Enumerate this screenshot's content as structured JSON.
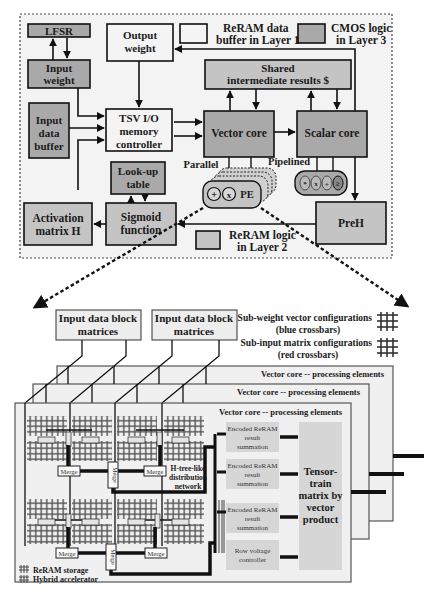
{
  "top_diagram": {
    "blocks": {
      "lfsr": "LFSR",
      "input_weight": [
        "Input",
        "weight"
      ],
      "output_weight": [
        "Output",
        "weight"
      ],
      "input_data_buffer": [
        "Input",
        "data",
        "buffer"
      ],
      "tsv_controller": [
        "TSV I/O",
        "memory",
        "controller"
      ],
      "shared_results": [
        "Shared",
        "intermediate results $"
      ],
      "vector_core": "Vector core",
      "scalar_core": "Scalar core",
      "lookup_table": [
        "Look-up",
        "table"
      ],
      "activation_matrix": [
        "Activation",
        "matrix H"
      ],
      "sigmoid": [
        "Sigmoid",
        "function"
      ],
      "preh": "PreH",
      "pe": "PE"
    },
    "labels": {
      "parallel": "Parallel",
      "pipelined": "Pipelined"
    },
    "pe_ops": [
      "+",
      "x"
    ],
    "scalar_ops": [
      "*",
      "x",
      "÷",
      "≥"
    ],
    "legend": {
      "reram_buffer": [
        "ReRAM data",
        "buffer in Layer 1"
      ],
      "cmos_logic": [
        "CMOS logic",
        "in Layer 3"
      ],
      "reram_logic": [
        "ReRAM logic",
        "in Layer 2"
      ]
    },
    "colors": {
      "cmos": "#a9a9a9",
      "reram_logic": "#c4c4c4",
      "reram_buffer": "#f4f4f4"
    }
  },
  "bottom_diagram": {
    "input_blocks": [
      [
        "Input data block",
        "matrices"
      ],
      [
        "Input data block",
        "matrices"
      ]
    ],
    "legend": {
      "sub_weight": [
        "Sub-weight vector configurations",
        "(blue crossbars)"
      ],
      "sub_input": [
        "Sub-input matrix  configurations",
        "(red crossbars)"
      ],
      "reram_storage": "ReRAM storage",
      "hybrid_accelerator": "Hybrid accelerator"
    },
    "layers": [
      "Vector core -- processing elements",
      "Vector core -- processing elements",
      "Vector core -- processing elements"
    ],
    "merge_label": "Merge",
    "htree_label": [
      "H-tree-like",
      "distribution",
      "network"
    ],
    "summation_blocks": [
      [
        "Encoded ReRAM",
        "result",
        "summation"
      ],
      [
        "Encoded ReRAM",
        "result",
        "summation"
      ],
      [
        "Encoded ReRAM",
        "result",
        "summation"
      ]
    ],
    "row_voltage": [
      "Row voltage",
      "controller"
    ],
    "ttm_block": [
      "Tensor-",
      "train",
      "matrix by",
      "vector",
      "product"
    ]
  }
}
